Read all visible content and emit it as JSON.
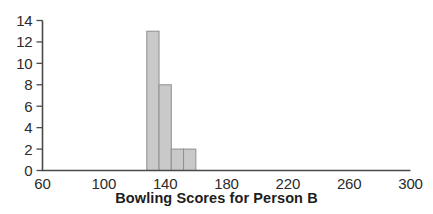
{
  "chart_data": {
    "type": "bar",
    "title": "Bowling Scores for Person B",
    "subtitle": "",
    "xlabel": "Bowling Scores for Person B",
    "ylabel": "",
    "xlim": [
      60,
      300
    ],
    "ylim": [
      0,
      14
    ],
    "grid": false,
    "legend": false,
    "bin_width": 8,
    "categories": [
      "128-136",
      "136-144",
      "144-152",
      "152-160"
    ],
    "bin_edges": [
      128,
      136,
      144,
      152,
      160
    ],
    "values": [
      13,
      8,
      2,
      2
    ],
    "x_tick_labels": [
      "60",
      "100",
      "140",
      "180",
      "220",
      "260",
      "300"
    ],
    "x_tick_values": [
      60,
      100,
      140,
      180,
      220,
      260,
      300
    ],
    "y_tick_labels": [
      "0",
      "2",
      "4",
      "6",
      "8",
      "10",
      "12",
      "14"
    ],
    "y_tick_values": [
      0,
      2,
      4,
      6,
      8,
      10,
      12,
      14
    ],
    "bar_fill_color": "#c9c9c9",
    "bar_border_color": "#8f8f8f",
    "axis_color": "#4a4a4a"
  }
}
